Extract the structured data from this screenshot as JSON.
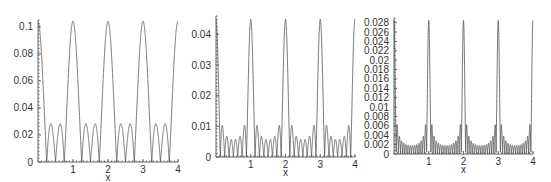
{
  "chart_data": [
    {
      "type": "line",
      "title": "",
      "xlabel": "x",
      "ylabel": "",
      "xlim": [
        0,
        4
      ],
      "ylim": [
        0,
        0.105
      ],
      "x_ticks": [
        "1",
        "2",
        "3",
        "4"
      ],
      "x_origin_label": "",
      "y_ticks": [
        "0",
        "0.02",
        "0.04",
        "0.06",
        "0.08",
        "0.1"
      ],
      "y_tick_values": [
        0,
        0.02,
        0.04,
        0.06,
        0.07999,
        0.1
      ],
      "grid": false,
      "legend": null,
      "series": [
        {
          "name": "curve",
          "peak_value": 0.104,
          "periodic_peaks_at_x": [
            0,
            1,
            2,
            3,
            4
          ],
          "secondary_lobe_maxima": [
            0.041,
            0.03,
            0.041
          ],
          "lobes_between_peaks": 3
        }
      ],
      "frame": {
        "x0": 38,
        "x1": 178,
        "y0": 162,
        "ytop": 20
      }
    },
    {
      "type": "line",
      "title": "",
      "xlabel": "x",
      "ylabel": "",
      "xlim": [
        0,
        4
      ],
      "ylim": [
        0,
        0.046
      ],
      "x_ticks": [
        "1",
        "2",
        "3",
        "4"
      ],
      "y_ticks": [
        "0",
        "0.01",
        "0.02",
        "0.03",
        "0.04"
      ],
      "y_tick_values": [
        0,
        0.01,
        0.02,
        0.03,
        0.04
      ],
      "grid": false,
      "legend": null,
      "series": [
        {
          "name": "curve",
          "peak_value": 0.045,
          "periodic_peaks_at_x": [
            0,
            1,
            2,
            3,
            4
          ],
          "secondary_lobe_maxima": [
            0.016,
            0.009,
            0.007,
            0.007,
            0.007,
            0.009,
            0.016
          ],
          "lobes_between_peaks": 7
        }
      ],
      "frame": {
        "x0": 216,
        "x1": 355,
        "y0": 157,
        "ytop": 16
      }
    },
    {
      "type": "line",
      "title": "",
      "xlabel": "x",
      "ylabel": "",
      "xlim": [
        0,
        4
      ],
      "ylim": [
        0,
        0.029
      ],
      "x_ticks": [
        "1",
        "2",
        "3",
        "4"
      ],
      "y_ticks": [
        "0",
        "0.002",
        "0.004",
        "0.006",
        "0.008",
        "0.01",
        "0.012",
        "0.014",
        "0.016",
        "0.018",
        "0.02",
        "0.022",
        "0.024",
        "0.026",
        "0.028"
      ],
      "y_tick_values": [
        0,
        0.002,
        0.004,
        0.006,
        0.008,
        0.01,
        0.012,
        0.014,
        0.016,
        0.018,
        0.02,
        0.022,
        0.024,
        0.026,
        0.028
      ],
      "grid": false,
      "legend": null,
      "series": [
        {
          "name": "curve",
          "peak_value": 0.0285,
          "periodic_peaks_at_x": [
            0,
            1,
            2,
            3,
            4
          ],
          "secondary_lobe_maxima": [
            0.01,
            0.005,
            0.004,
            0.003,
            0.003,
            0.003,
            0.003,
            0.003,
            0.003,
            0.003,
            0.003,
            0.003,
            0.004,
            0.005,
            0.01
          ],
          "lobes_between_peaks": 15
        }
      ],
      "frame": {
        "x0": 394,
        "x1": 533,
        "y0": 154,
        "ytop": 18
      }
    }
  ],
  "panels": [
    {
      "n": 4,
      "peak": 0.104
    },
    {
      "n": 8,
      "peak": 0.045
    },
    {
      "n": 16,
      "peak": 0.0285
    }
  ]
}
